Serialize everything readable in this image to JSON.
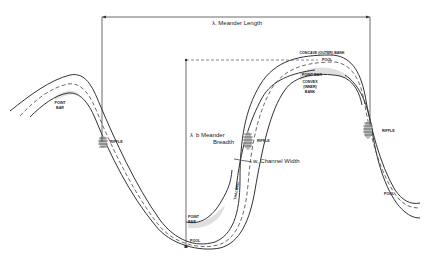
{
  "diagram": {
    "labels": {
      "meander_length": "λ, Meander Length",
      "meander_breadth_1": "λ",
      "meander_breadth_2": "b Meander",
      "meander_breadth_3": "Breadth",
      "channel_width": "w, Channel Width",
      "thalweg": "THALWEG",
      "concave_bank": "CONCAVE (OUTER) BANK",
      "pool_top": "POOL",
      "point_bar_top": "POINT BAR",
      "convex_bank_1": "CONVEX",
      "convex_bank_2": "(INNER)",
      "convex_bank_3": "BANK",
      "point_bar_left_1": "POINT",
      "point_bar_left_2": "BAR",
      "riffle_left": "RIFFLE",
      "riffle_center": "RIFFLE",
      "riffle_right": "RIFFLE",
      "point_bar_bottom_1": "POINT",
      "point_bar_bottom_2": "BAR",
      "pool_bottom": "POOL",
      "pool_right": "POOL"
    }
  }
}
